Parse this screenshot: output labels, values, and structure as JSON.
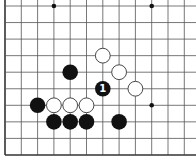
{
  "board": {
    "origin_x": 5,
    "origin_y": 6,
    "spacing_x": 16.3,
    "spacing_y": 16.55,
    "cols_visible": 12,
    "rows_visible": 10,
    "edges": {
      "left": true,
      "bottom": true,
      "top": false,
      "right": false
    },
    "line_color": "#555555",
    "edge_color": "#333333",
    "background": "#ffffff"
  },
  "star_points": [
    {
      "col": 3,
      "row": 0
    },
    {
      "col": 9,
      "row": 0
    },
    {
      "col": 9,
      "row": 6
    }
  ],
  "stones": [
    {
      "color": "black",
      "col": 4,
      "row": 4
    },
    {
      "color": "white",
      "col": 6,
      "row": 3
    },
    {
      "color": "white",
      "col": 7,
      "row": 4
    },
    {
      "color": "black",
      "col": 6,
      "row": 5,
      "mark": "1"
    },
    {
      "color": "white",
      "col": 8,
      "row": 5
    },
    {
      "color": "black",
      "col": 2,
      "row": 6
    },
    {
      "color": "white",
      "col": 3,
      "row": 6
    },
    {
      "color": "white",
      "col": 4,
      "row": 6
    },
    {
      "color": "white",
      "col": 5,
      "row": 6
    },
    {
      "color": "black",
      "col": 3,
      "row": 7
    },
    {
      "color": "black",
      "col": 4,
      "row": 7
    },
    {
      "color": "black",
      "col": 5,
      "row": 7
    },
    {
      "color": "black",
      "col": 7,
      "row": 7
    }
  ]
}
